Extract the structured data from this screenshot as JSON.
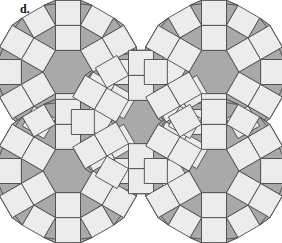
{
  "figure": {
    "label": "d.",
    "caption_text": "d.",
    "kind": "geometric-tiling-diagram",
    "width": 282,
    "height": 243
  },
  "colors": {
    "background": "#ffffff",
    "dark_tile": "#a9a9a9",
    "light_tile": "#ececec",
    "stroke": "#4a4a4a",
    "label_color": "#111111"
  },
  "geometry": {
    "edge": 25,
    "rosette_centers": [
      {
        "name": "top-left",
        "cx": 68,
        "cy": 72
      },
      {
        "name": "bottom-left",
        "cx": 68,
        "cy": 171
      },
      {
        "name": "center",
        "cx": 141,
        "cy": 122
      },
      {
        "name": "top-right",
        "cx": 214,
        "cy": 72
      },
      {
        "name": "bottom-right",
        "cx": 214,
        "cy": 171
      }
    ],
    "hexagon_count": 5,
    "square_count": 48,
    "triangle_count": 72
  },
  "chart_data": {
    "type": "diagram",
    "title": "d.",
    "tile_types": [
      {
        "shape": "hexagon",
        "fill": "#a9a9a9",
        "count": 5
      },
      {
        "shape": "square",
        "fill": "#ececec",
        "count": 48
      },
      {
        "shape": "triangle",
        "fill": "#a9a9a9",
        "count": 72
      }
    ]
  }
}
